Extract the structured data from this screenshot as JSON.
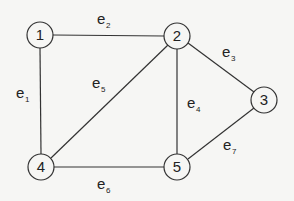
{
  "graph": {
    "nodes": [
      {
        "id": "1",
        "label": "1",
        "x": 40,
        "y": 35
      },
      {
        "id": "2",
        "label": "2",
        "x": 177,
        "y": 36
      },
      {
        "id": "3",
        "label": "3",
        "x": 264,
        "y": 100
      },
      {
        "id": "4",
        "label": "4",
        "x": 41,
        "y": 167
      },
      {
        "id": "5",
        "label": "5",
        "x": 177,
        "y": 167
      }
    ],
    "edges": [
      {
        "id": "e1",
        "label": "e",
        "sub": "1",
        "from": "1",
        "to": "4"
      },
      {
        "id": "e2",
        "label": "e",
        "sub": "2",
        "from": "1",
        "to": "2"
      },
      {
        "id": "e3",
        "label": "e",
        "sub": "3",
        "from": "2",
        "to": "3"
      },
      {
        "id": "e4",
        "label": "e",
        "sub": "4",
        "from": "2",
        "to": "5"
      },
      {
        "id": "e5",
        "label": "e",
        "sub": "5",
        "from": "2",
        "to": "4"
      },
      {
        "id": "e6",
        "label": "e",
        "sub": "6",
        "from": "4",
        "to": "5"
      },
      {
        "id": "e7",
        "label": "e",
        "sub": "7",
        "from": "3",
        "to": "5"
      }
    ]
  }
}
